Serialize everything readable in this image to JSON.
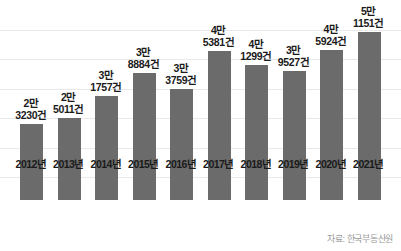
{
  "chart_data": {
    "type": "bar",
    "title": "",
    "subtitle": "",
    "xlabel": "",
    "ylabel": "",
    "categories": [
      "2012년",
      "2013년",
      "2014년",
      "2015년",
      "2016년",
      "2017년",
      "2018년",
      "2019년",
      "2020년",
      "2021년"
    ],
    "values": [
      23230,
      25011,
      31757,
      38884,
      33759,
      45381,
      41299,
      39527,
      45924,
      51151
    ],
    "value_labels": [
      {
        "unit": "2만",
        "number": "3230건"
      },
      {
        "unit": "2만",
        "number": "5011건"
      },
      {
        "unit": "3만",
        "number": "1757건"
      },
      {
        "unit": "3만",
        "number": "8884건"
      },
      {
        "unit": "3만",
        "number": "3759건"
      },
      {
        "unit": "4만",
        "number": "5381건"
      },
      {
        "unit": "4만",
        "number": "1299건"
      },
      {
        "unit": "3만",
        "number": "9527건"
      },
      {
        "unit": "4만",
        "number": "5924건"
      },
      {
        "unit": "5만",
        "number": "1151건"
      }
    ],
    "ylim": [
      0,
      58000
    ],
    "grid": true,
    "gridline_values": [
      52000,
      43000,
      34000,
      25000,
      16000,
      7000
    ],
    "legend": [],
    "legend_position": "none",
    "bar_color": "#6b6b6b",
    "background_color": "#ffffff",
    "gridline_color": "#e9e9e9"
  },
  "footer": {
    "source_note": "자료: 한국부동산원"
  }
}
